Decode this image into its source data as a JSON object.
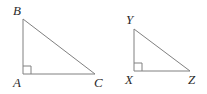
{
  "figure": {
    "background_color": "#ffffff",
    "stroke_color": "#808080",
    "stroke_width": 1,
    "label_color": "#2b2b2b",
    "right_angle_mark_size": 8,
    "width": 207,
    "height": 94,
    "triangles": [
      {
        "name": "triangle-abc",
        "vertices": [
          {
            "label": "B",
            "x": 23,
            "y": 19,
            "label_x": 13,
            "label_y": 4
          },
          {
            "label": "A",
            "x": 23,
            "y": 74,
            "label_x": 13,
            "label_y": 76
          },
          {
            "label": "C",
            "x": 95,
            "y": 74,
            "label_x": 94,
            "label_y": 76
          }
        ],
        "right_angle_at": "A",
        "right_angle_x": 23,
        "right_angle_y": 74
      },
      {
        "name": "triangle-xyz",
        "vertices": [
          {
            "label": "Y",
            "x": 134,
            "y": 29,
            "label_x": 126,
            "label_y": 13
          },
          {
            "label": "X",
            "x": 134,
            "y": 71,
            "label_x": 125,
            "label_y": 73
          },
          {
            "label": "Z",
            "x": 190,
            "y": 71,
            "label_x": 188,
            "label_y": 73
          }
        ],
        "right_angle_at": "X",
        "right_angle_x": 134,
        "right_angle_y": 71
      }
    ]
  }
}
